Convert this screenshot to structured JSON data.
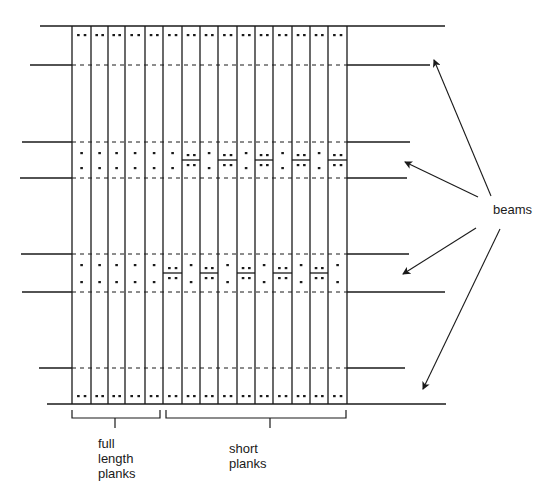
{
  "diagram": {
    "labels": {
      "full_length_planks": [
        "full",
        "length",
        "planks"
      ],
      "short_planks": [
        "short",
        "planks"
      ],
      "beams": "beams"
    },
    "colors": {
      "line": "#1a1a1a",
      "background": "#ffffff"
    },
    "plank_count": 15,
    "full_length_plank_count": 5,
    "short_plank_count": 10,
    "beam_count": 4,
    "plank_lines_x": [
      72,
      91,
      108,
      125,
      145,
      163,
      182,
      200,
      218,
      237,
      255,
      273,
      292,
      310,
      328,
      347
    ],
    "beams": [
      {
        "name": "beam-top",
        "top_edge": {
          "y": 26,
          "x1": 40,
          "x2": 445
        },
        "bottom_edge": {
          "y": 65,
          "x1": 30,
          "x2": 430
        }
      },
      {
        "name": "beam-2",
        "top_edge": {
          "y": 142,
          "x1": 22,
          "x2": 410
        },
        "bottom_edge": {
          "y": 178,
          "x1": 20,
          "x2": 407
        }
      },
      {
        "name": "beam-3",
        "top_edge": {
          "y": 254,
          "x1": 21,
          "x2": 409
        },
        "bottom_edge": {
          "y": 292,
          "x1": 22,
          "x2": 445
        }
      },
      {
        "name": "beam-bottom",
        "top_edge": {
          "y": 368,
          "x1": 39,
          "x2": 405
        },
        "bottom_edge": {
          "y": 404,
          "x1": 47,
          "x2": 446
        }
      }
    ],
    "short_plank_joints": {
      "beam-2": [
        6,
        8,
        10,
        12,
        14
      ],
      "beam-3": [
        5,
        7,
        9,
        11,
        13
      ]
    },
    "arrows": [
      {
        "from": [
          491,
          196
        ],
        "to": [
          434,
          60
        ]
      },
      {
        "from": [
          478,
          197
        ],
        "to": [
          405,
          162
        ]
      },
      {
        "from": [
          476,
          228
        ],
        "to": [
          403,
          274
        ]
      },
      {
        "from": [
          500,
          229
        ],
        "to": [
          423,
          389
        ]
      }
    ],
    "brackets": [
      {
        "name": "full-length-bracket",
        "x1": 72,
        "x2": 160,
        "y": 418
      },
      {
        "name": "short-planks-bracket",
        "x1": 166,
        "x2": 346,
        "y": 418
      }
    ]
  }
}
